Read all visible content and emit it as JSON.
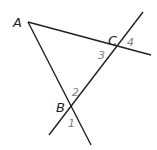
{
  "diagram": {
    "type": "triangle-with-extended-sides",
    "points": {
      "A": {
        "label": "A",
        "x": 28,
        "y": 22
      },
      "B": {
        "label": "B",
        "x": 72,
        "y": 106
      },
      "C": {
        "label": "C",
        "x": 116,
        "y": 47
      }
    },
    "lines": [
      {
        "name": "line-AC-extended",
        "x1": 28,
        "y1": 22,
        "x2": 151,
        "y2": 55
      },
      {
        "name": "line-AB-extended",
        "x1": 28,
        "y1": 22,
        "x2": 91,
        "y2": 145
      },
      {
        "name": "transversal-BC",
        "x1": 49,
        "y1": 135,
        "x2": 143,
        "y2": 12
      }
    ],
    "angle_labels": [
      {
        "label": "1",
        "x": 68,
        "y": 127
      },
      {
        "label": "2",
        "x": 72,
        "y": 96
      },
      {
        "label": "3",
        "x": 98,
        "y": 58
      },
      {
        "label": "4",
        "x": 127,
        "y": 47
      }
    ],
    "colors": {
      "line": "#231f20",
      "point_label": "#231f20",
      "angle_label": "#808080"
    }
  }
}
